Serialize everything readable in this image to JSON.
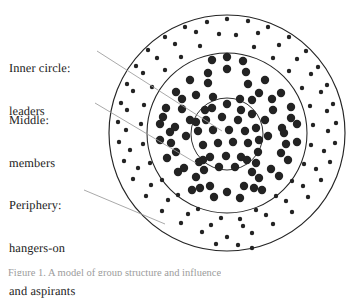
{
  "figure": {
    "kind": "concentric-circles-membership-diagram",
    "background_color": "#ffffff",
    "stroke_color": "#252525",
    "dot_color": "#232323",
    "leader_color": "#9a9a9a"
  },
  "labels": {
    "inner": {
      "line1": "Inner circle:",
      "line2": "leaders"
    },
    "middle": {
      "line1": "Middle:",
      "line2": "members"
    },
    "periphery": {
      "line1": "Periphery:",
      "line2": "hangers-on",
      "line3": "and aspirants"
    }
  },
  "caption": {
    "text": "Figure 1. A model of group structure and influence"
  },
  "chart_data": {
    "type": "scatter",
    "title": "",
    "xlabel": "",
    "ylabel": "",
    "rings": [
      {
        "name": "inner",
        "label": "Inner circle: leaders",
        "radius": 36,
        "dot_size": "large",
        "count": 30
      },
      {
        "name": "middle",
        "label": "Middle: members",
        "radius": 80,
        "dot_size": "large",
        "count": 58
      },
      {
        "name": "periphery",
        "label": "Periphery: hangers-on and aspirants",
        "radius": 118,
        "dot_size": "small",
        "count": 86
      }
    ],
    "center": [
      227,
      133
    ],
    "grid": false,
    "legend_position": "left"
  },
  "geometry": {
    "circles": [
      {
        "name": "outer-circle",
        "cx": 227,
        "cy": 133,
        "r": 118,
        "stroke_width": 1.15
      },
      {
        "name": "middle-circle",
        "cx": 227,
        "cy": 133,
        "r": 80,
        "stroke_width": 1.05
      },
      {
        "name": "inner-circle",
        "cx": 227,
        "cy": 134,
        "r": 36,
        "stroke_width": 0.95
      }
    ],
    "leaders": [
      {
        "name": "leader-inner",
        "x1": 97,
        "y1": 51,
        "x2": 222,
        "y2": 131
      },
      {
        "name": "leader-middle",
        "x1": 95,
        "y1": 103,
        "x2": 196,
        "y2": 163
      },
      {
        "name": "leader-periphery",
        "x1": 84,
        "y1": 190,
        "x2": 165,
        "y2": 224
      }
    ],
    "dots_large": [
      [
        227,
        104
      ],
      [
        212,
        108
      ],
      [
        241,
        110
      ],
      [
        206,
        120
      ],
      [
        222,
        117
      ],
      [
        238,
        120
      ],
      [
        252,
        114
      ],
      [
        198,
        131
      ],
      [
        213,
        130
      ],
      [
        229,
        130
      ],
      [
        245,
        131
      ],
      [
        256,
        128
      ],
      [
        203,
        145
      ],
      [
        218,
        143
      ],
      [
        233,
        142
      ],
      [
        248,
        143
      ],
      [
        259,
        140
      ],
      [
        210,
        157
      ],
      [
        226,
        156
      ],
      [
        241,
        157
      ],
      [
        219,
        167
      ],
      [
        235,
        167
      ],
      [
        205,
        110
      ],
      [
        252,
        100
      ],
      [
        196,
        122
      ],
      [
        258,
        152
      ],
      [
        213,
        97
      ],
      [
        240,
        99
      ],
      [
        247,
        160
      ],
      [
        203,
        160
      ],
      [
        227,
        69
      ],
      [
        208,
        73
      ],
      [
        246,
        72
      ],
      [
        190,
        80
      ],
      [
        265,
        80
      ],
      [
        176,
        92
      ],
      [
        281,
        93
      ],
      [
        196,
        95
      ],
      [
        259,
        93
      ],
      [
        166,
        108
      ],
      [
        291,
        107
      ],
      [
        182,
        109
      ],
      [
        273,
        110
      ],
      [
        160,
        124
      ],
      [
        297,
        124
      ],
      [
        175,
        127
      ],
      [
        282,
        128
      ],
      [
        160,
        140
      ],
      [
        297,
        142
      ],
      [
        176,
        152
      ],
      [
        281,
        153
      ],
      [
        167,
        158
      ],
      [
        288,
        160
      ],
      [
        184,
        168
      ],
      [
        271,
        169
      ],
      [
        196,
        177
      ],
      [
        259,
        178
      ],
      [
        178,
        172
      ],
      [
        279,
        176
      ],
      [
        210,
        186
      ],
      [
        244,
        186
      ],
      [
        192,
        190
      ],
      [
        262,
        190
      ],
      [
        227,
        192
      ],
      [
        214,
        197
      ],
      [
        240,
        198
      ],
      [
        204,
        170
      ],
      [
        252,
        172
      ],
      [
        186,
        136
      ],
      [
        268,
        136
      ],
      [
        190,
        120
      ],
      [
        265,
        120
      ],
      [
        208,
        83
      ],
      [
        248,
        84
      ],
      [
        171,
        143
      ],
      [
        286,
        144
      ],
      [
        200,
        188
      ],
      [
        254,
        188
      ],
      [
        227,
        57
      ],
      [
        212,
        60
      ],
      [
        243,
        61
      ],
      [
        182,
        99
      ],
      [
        272,
        99
      ],
      [
        163,
        117
      ],
      [
        291,
        118
      ],
      [
        170,
        132
      ],
      [
        284,
        133
      ],
      [
        199,
        162
      ],
      [
        256,
        163
      ]
    ],
    "dots_small": [
      [
        227,
        19
      ],
      [
        207,
        22
      ],
      [
        248,
        21
      ],
      [
        185,
        27
      ],
      [
        268,
        27
      ],
      [
        165,
        37
      ],
      [
        289,
        37
      ],
      [
        148,
        50
      ],
      [
        306,
        51
      ],
      [
        136,
        66
      ],
      [
        318,
        67
      ],
      [
        127,
        84
      ],
      [
        327,
        85
      ],
      [
        121,
        103
      ],
      [
        333,
        104
      ],
      [
        118,
        122
      ],
      [
        336,
        123
      ],
      [
        119,
        142
      ],
      [
        335,
        143
      ],
      [
        124,
        161
      ],
      [
        330,
        162
      ],
      [
        133,
        179
      ],
      [
        321,
        180
      ],
      [
        146,
        196
      ],
      [
        308,
        197
      ],
      [
        162,
        211
      ],
      [
        292,
        212
      ],
      [
        181,
        223
      ],
      [
        273,
        224
      ],
      [
        202,
        232
      ],
      [
        252,
        233
      ],
      [
        227,
        237
      ],
      [
        196,
        32
      ],
      [
        258,
        33
      ],
      [
        175,
        44
      ],
      [
        279,
        45
      ],
      [
        157,
        58
      ],
      [
        297,
        59
      ],
      [
        143,
        73
      ],
      [
        311,
        74
      ],
      [
        133,
        91
      ],
      [
        321,
        92
      ],
      [
        127,
        110
      ],
      [
        327,
        111
      ],
      [
        126,
        130
      ],
      [
        328,
        131
      ],
      [
        130,
        150
      ],
      [
        324,
        151
      ],
      [
        138,
        168
      ],
      [
        316,
        169
      ],
      [
        151,
        185
      ],
      [
        303,
        186
      ],
      [
        168,
        200
      ],
      [
        286,
        201
      ],
      [
        188,
        214
      ],
      [
        266,
        215
      ],
      [
        211,
        225
      ],
      [
        243,
        226
      ],
      [
        219,
        34
      ],
      [
        236,
        35
      ],
      [
        200,
        46
      ],
      [
        254,
        47
      ],
      [
        181,
        57
      ],
      [
        273,
        58
      ],
      [
        165,
        70
      ],
      [
        289,
        71
      ],
      [
        152,
        87
      ],
      [
        302,
        88
      ],
      [
        144,
        105
      ],
      [
        310,
        106
      ],
      [
        141,
        124
      ],
      [
        313,
        125
      ],
      [
        143,
        144
      ],
      [
        311,
        145
      ],
      [
        150,
        163
      ],
      [
        304,
        164
      ],
      [
        162,
        180
      ],
      [
        292,
        181
      ],
      [
        178,
        195
      ],
      [
        276,
        196
      ],
      [
        198,
        209
      ],
      [
        256,
        210
      ],
      [
        221,
        218
      ],
      [
        240,
        219
      ],
      [
        216,
        244
      ],
      [
        238,
        245
      ],
      [
        252,
        248
      ]
    ]
  }
}
